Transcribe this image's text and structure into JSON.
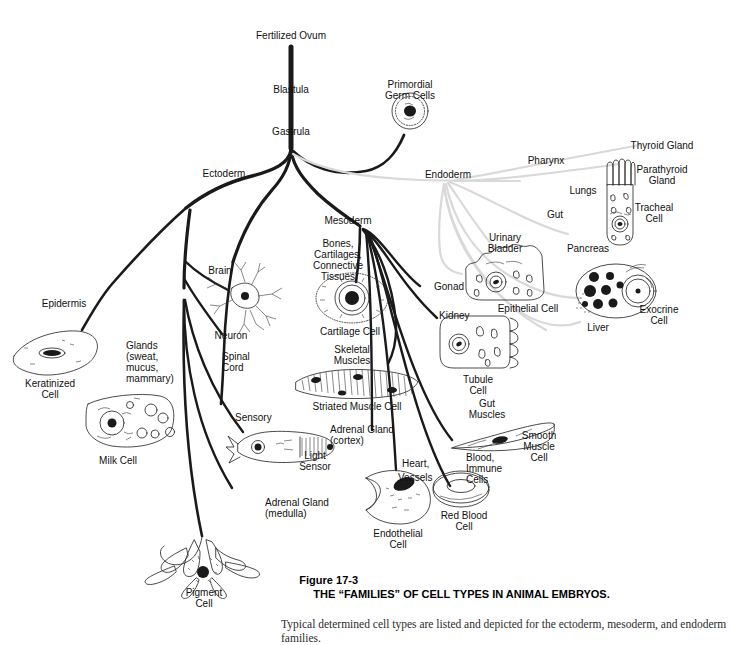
{
  "figure": {
    "number": "Figure 17-3",
    "title": "THE “FAMILIES” OF CELL TYPES IN ANIMAL EMBRYOS.",
    "caption": "Typical determined cell types are listed and depicted for the ectoderm, mesoderm, and endoderm families."
  },
  "colors": {
    "background": "#ffffff",
    "primary_branch": "#1a1a1a",
    "endoderm_branch": "#d8d8d8",
    "text": "#111111",
    "caption_text": "#2b2b2b"
  },
  "stem": {
    "fertilized_ovum": "Fertilized Ovum",
    "blastula": "Blastula",
    "gastrula": "Gastrula"
  },
  "germ_layers": {
    "ectoderm": "Ectoderm",
    "mesoderm": "Mesoderm",
    "endoderm": "Endoderm"
  },
  "branches": {
    "primordial_germ_cells": "Primordial\nGerm Cells",
    "ectoderm": [
      {
        "label": "Epidermis",
        "cell": "Keratinized\nCell"
      },
      {
        "label": "Glands\n(sweat,\nmucus,\nmammary)",
        "cell": "Milk Cell"
      },
      {
        "label": "Brain",
        "cell": "Neuron"
      },
      {
        "label": "Spinal\nCord",
        "cell": ""
      },
      {
        "label": "Sensory",
        "cell": "Light\nSensor"
      },
      {
        "label": "Adrenal Gland\n(medulla)",
        "cell": ""
      },
      {
        "label": "",
        "cell": "Pigment\nCell"
      }
    ],
    "mesoderm": [
      {
        "label": "Bones,\nCartilages,\nConnective\nTissues",
        "cell": "Cartilage Cell"
      },
      {
        "label": "Skeletal\nMuscles",
        "cell": "Striated Muscle Cell"
      },
      {
        "label": "Gonad",
        "cell": ""
      },
      {
        "label": "Kidney",
        "cell": "Tubule\nCell"
      },
      {
        "label": "Gut\nMuscles",
        "cell": "Smooth\nMuscle\nCell"
      },
      {
        "label": "Adrenal Gland\n(cortex)",
        "cell": ""
      },
      {
        "label": "Heart,\nVessels",
        "cell": "Endothelial\nCell"
      },
      {
        "label": "Blood,\nImmune\nCells",
        "cell": "Red Blood\nCell"
      }
    ],
    "endoderm": [
      {
        "label": "Pharynx",
        "cell": ""
      },
      {
        "label": "Thyroid Gland",
        "cell": ""
      },
      {
        "label": "Parathyroid\nGland",
        "cell": ""
      },
      {
        "label": "Lungs",
        "cell": "Tracheal\nCell"
      },
      {
        "label": "Gut",
        "cell": ""
      },
      {
        "label": "Urinary\nBladder",
        "cell": "Epithelial Cell"
      },
      {
        "label": "Pancreas",
        "cell": "Exocrine\nCell"
      },
      {
        "label": "Liver",
        "cell": ""
      }
    ]
  },
  "labels": {
    "fertilized_ovum": "Fertilized Ovum",
    "blastula": "Blastula",
    "gastrula": "Gastrula",
    "primordial_germ_cells_1": "Primordial",
    "primordial_germ_cells_2": "Germ Cells",
    "ectoderm": "Ectoderm",
    "mesoderm": "Mesoderm",
    "endoderm": "Endoderm",
    "epidermis": "Epidermis",
    "keratinized_cell_1": "Keratinized",
    "keratinized_cell_2": "Cell",
    "glands_1": "Glands",
    "glands_2": "(sweat,",
    "glands_3": "mucus,",
    "glands_4": "mammary)",
    "milk_cell": "Milk Cell",
    "brain": "Brain",
    "neuron": "Neuron",
    "spinal_cord_1": "Spinal",
    "spinal_cord_2": "Cord",
    "sensory": "Sensory",
    "light_sensor_1": "Light",
    "light_sensor_2": "Sensor",
    "adrenal_medulla_1": "Adrenal Gland",
    "adrenal_medulla_2": "(medulla)",
    "pigment_cell_1": "Pigment",
    "pigment_cell_2": "Cell",
    "bones_1": "Bones,",
    "bones_2": "Cartilages,",
    "bones_3": "Connective",
    "bones_4": "Tissues",
    "cartilage_cell": "Cartilage Cell",
    "skeletal_muscles_1": "Skeletal",
    "skeletal_muscles_2": "Muscles",
    "striated_muscle_cell": "Striated Muscle Cell",
    "gonad": "Gonad",
    "kidney": "Kidney",
    "tubule_cell_1": "Tubule",
    "tubule_cell_2": "Cell",
    "gut_muscles_1": "Gut",
    "gut_muscles_2": "Muscles",
    "smooth_muscle_1": "Smooth",
    "smooth_muscle_2": "Muscle",
    "smooth_muscle_3": "Cell",
    "adrenal_cortex_1": "Adrenal Gland",
    "adrenal_cortex_2": "(cortex)",
    "heart_vessels_1": "Heart,",
    "heart_vessels_2": "Vessels",
    "endothelial_cell_1": "Endothelial",
    "endothelial_cell_2": "Cell",
    "blood_immune_1": "Blood,",
    "blood_immune_2": "Immune",
    "blood_immune_3": "Cells",
    "red_blood_cell_1": "Red Blood",
    "red_blood_cell_2": "Cell",
    "pharynx": "Pharynx",
    "thyroid_gland": "Thyroid Gland",
    "parathyroid_1": "Parathyroid",
    "parathyroid_2": "Gland",
    "lungs": "Lungs",
    "tracheal_cell_1": "Tracheal",
    "tracheal_cell_2": "Cell",
    "gut": "Gut",
    "urinary_bladder_1": "Urinary",
    "urinary_bladder_2": "Bladder",
    "epithelial_cell": "Epithelial Cell",
    "pancreas": "Pancreas",
    "exocrine_cell_1": "Exocrine",
    "exocrine_cell_2": "Cell",
    "liver": "Liver",
    "caption_head": "Figure 17-3",
    "caption_title": "THE “FAMILIES” OF CELL TYPES IN ANIMAL EMBRYOS.",
    "caption_body": "Typical determined cell types are listed and depicted for the ectoderm, mesoderm, and endoderm families."
  }
}
